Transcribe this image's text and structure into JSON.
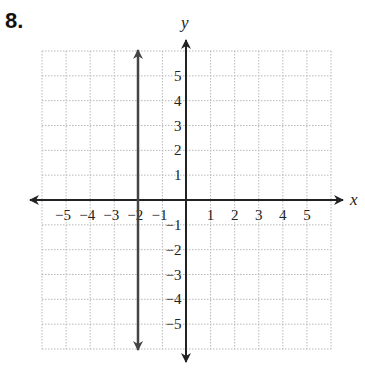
{
  "problem": {
    "number": "8."
  },
  "chart_data": {
    "type": "line",
    "title": "",
    "xlabel": "x",
    "ylabel": "y",
    "xlim": [
      -6,
      6
    ],
    "ylim": [
      -6,
      6
    ],
    "grid": true,
    "grid_style": "dotted",
    "x_ticks": [
      "−5",
      "−4",
      "−3",
      "−2",
      "−1",
      "1",
      "2",
      "3",
      "4",
      "5"
    ],
    "y_ticks": [
      "5",
      "4",
      "3",
      "2",
      "1",
      "−1",
      "−2",
      "−3",
      "−4",
      "−5"
    ],
    "series": [
      {
        "name": "x = -2",
        "type": "vertical_line",
        "x": -2,
        "y_range": [
          -6,
          6
        ],
        "arrows": "both",
        "color": "#444444"
      }
    ]
  },
  "colors": {
    "grid": "#b8b8b8",
    "axis": "#222222",
    "line": "#444444"
  }
}
